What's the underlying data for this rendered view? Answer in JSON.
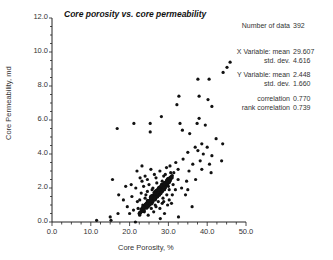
{
  "chart_data": {
    "type": "scatter",
    "title": "Core porosity vs. core permeability",
    "xlabel": "Core Porosity, %",
    "ylabel": "Core Permeability, md",
    "xlim": [
      0,
      50
    ],
    "ylim": [
      0,
      12
    ],
    "x_ticks": [
      "0.0",
      "10.0",
      "20.0",
      "30.0",
      "40.0",
      "50.0"
    ],
    "y_ticks": [
      "0.0",
      "2.0",
      "4.0",
      "6.0",
      "8.0",
      "10.0",
      "12.0"
    ],
    "grid": false,
    "legend": null,
    "series": [
      {
        "name": "Core samples",
        "points": [
          [
            45.9,
            9.4
          ],
          [
            45.1,
            9.1
          ],
          [
            44.1,
            8.8
          ],
          [
            40.5,
            8.4
          ],
          [
            37.6,
            8.4
          ],
          [
            37.9,
            7.4
          ],
          [
            32.7,
            7.4
          ],
          [
            32.2,
            6.9
          ],
          [
            40.2,
            7.2
          ],
          [
            41.2,
            6.8
          ],
          [
            37.9,
            6.1
          ],
          [
            37.4,
            5.8
          ],
          [
            33.0,
            5.8
          ],
          [
            39.5,
            5.7
          ],
          [
            25.3,
            5.8
          ],
          [
            21.1,
            5.8
          ],
          [
            16.8,
            5.5
          ],
          [
            28.2,
            6.2
          ],
          [
            25.3,
            5.3
          ],
          [
            33.6,
            5.4
          ],
          [
            35.5,
            5.2
          ],
          [
            38.6,
            4.6
          ],
          [
            42.3,
            4.9
          ],
          [
            36.9,
            4.4
          ],
          [
            35.0,
            4.1
          ],
          [
            37.6,
            4.2
          ],
          [
            39.0,
            4.0
          ],
          [
            40.0,
            4.4
          ],
          [
            44.0,
            4.6
          ],
          [
            41.2,
            3.9
          ],
          [
            38.2,
            3.6
          ],
          [
            36.3,
            3.4
          ],
          [
            33.8,
            3.7
          ],
          [
            31.9,
            3.5
          ],
          [
            30.4,
            3.3
          ],
          [
            32.5,
            3.1
          ],
          [
            35.3,
            3.0
          ],
          [
            38.6,
            3.1
          ],
          [
            40.6,
            3.4
          ],
          [
            43.7,
            3.6
          ],
          [
            41.0,
            2.9
          ],
          [
            37.0,
            2.5
          ],
          [
            34.7,
            2.4
          ],
          [
            29.5,
            3.2
          ],
          [
            27.8,
            3.0
          ],
          [
            25.5,
            3.1
          ],
          [
            23.2,
            3.3
          ],
          [
            21.9,
            3.0
          ],
          [
            22.7,
            2.6
          ],
          [
            24.0,
            2.7
          ],
          [
            26.8,
            2.6
          ],
          [
            28.8,
            2.7
          ],
          [
            30.8,
            2.6
          ],
          [
            32.5,
            2.5
          ],
          [
            27.0,
            2.3
          ],
          [
            25.0,
            2.2
          ],
          [
            23.6,
            2.1
          ],
          [
            21.6,
            2.0
          ],
          [
            20.4,
            2.2
          ],
          [
            29.5,
            2.3
          ],
          [
            31.2,
            2.2
          ],
          [
            26.0,
            2.0
          ],
          [
            27.6,
            2.0
          ],
          [
            29.0,
            1.9
          ],
          [
            30.2,
            1.9
          ],
          [
            24.6,
            1.8
          ],
          [
            23.0,
            1.7
          ],
          [
            26.4,
            1.7
          ],
          [
            28.0,
            1.7
          ],
          [
            29.6,
            1.6
          ],
          [
            31.0,
            1.6
          ],
          [
            25.4,
            1.5
          ],
          [
            27.2,
            1.5
          ],
          [
            28.6,
            1.4
          ],
          [
            24.0,
            1.4
          ],
          [
            22.6,
            1.3
          ],
          [
            26.0,
            1.3
          ],
          [
            30.2,
            1.3
          ],
          [
            27.4,
            1.2
          ],
          [
            25.0,
            1.1
          ],
          [
            23.4,
            1.0
          ],
          [
            26.6,
            1.0
          ],
          [
            28.4,
            1.1
          ],
          [
            29.8,
            1.0
          ],
          [
            24.4,
            0.9
          ],
          [
            22.2,
            0.8
          ],
          [
            25.6,
            0.8
          ],
          [
            27.8,
            0.8
          ],
          [
            21.0,
            0.7
          ],
          [
            23.8,
            0.6
          ],
          [
            26.2,
            0.6
          ],
          [
            20.0,
            0.5
          ],
          [
            22.6,
            0.4
          ],
          [
            24.8,
            0.4
          ],
          [
            29.0,
            0.5
          ],
          [
            19.4,
            0.9
          ],
          [
            18.4,
            1.3
          ],
          [
            17.2,
            1.6
          ],
          [
            15.6,
            2.5
          ],
          [
            19.0,
            2.1
          ],
          [
            34.4,
            1.6
          ],
          [
            36.1,
            0.9
          ],
          [
            32.6,
            0.3
          ],
          [
            35.0,
            1.9
          ],
          [
            11.5,
            0.1
          ],
          [
            15.2,
            0.1
          ],
          [
            15.0,
            0.3
          ],
          [
            17.0,
            0.5
          ],
          [
            21.5,
            0.0
          ],
          [
            27.9,
            0.2
          ],
          [
            31.4,
            2.9
          ],
          [
            33.4,
            2.0
          ],
          [
            30.6,
            2.9
          ],
          [
            29.2,
            2.8
          ],
          [
            26.4,
            2.8
          ],
          [
            24.6,
            2.5
          ],
          [
            23.2,
            2.4
          ],
          [
            28.4,
            2.4
          ],
          [
            30.0,
            2.1
          ],
          [
            31.8,
            1.9
          ],
          [
            25.8,
            1.9
          ],
          [
            27.4,
            1.8
          ],
          [
            24.2,
            1.6
          ],
          [
            28.8,
            1.2
          ],
          [
            30.8,
            1.1
          ],
          [
            26.8,
            0.9
          ],
          [
            22.0,
            1.2
          ],
          [
            20.6,
            1.5
          ]
        ]
      }
    ],
    "annotations": [
      {
        "label": "Number of data",
        "value": "392"
      },
      {
        "label": "X Variable: mean",
        "value": "29.607"
      },
      {
        "label": "std. dev.",
        "value": "4.616"
      },
      {
        "label": "Y Variable: mean",
        "value": "2.448"
      },
      {
        "label": "std. dev.",
        "value": "1.660"
      },
      {
        "label": "correlation",
        "value": "0.770"
      },
      {
        "label": "rank correlation",
        "value": "0.739"
      }
    ]
  },
  "stats": {
    "n_label": "Number of data",
    "n_value": "392",
    "x_mean_label": "X Variable: mean",
    "x_mean_value": "29.607",
    "x_std_label": "std. dev.",
    "x_std_value": "4.616",
    "y_mean_label": "Y Variable: mean",
    "y_mean_value": "2.448",
    "y_std_label": "std. dev.",
    "y_std_value": "1.660",
    "corr_label": "correlation",
    "corr_value": "0.770",
    "rank_corr_label": "rank correlation",
    "rank_corr_value": "0.739"
  },
  "colors": {
    "points": "#111111",
    "axis": "#222222",
    "text": "#333333"
  }
}
